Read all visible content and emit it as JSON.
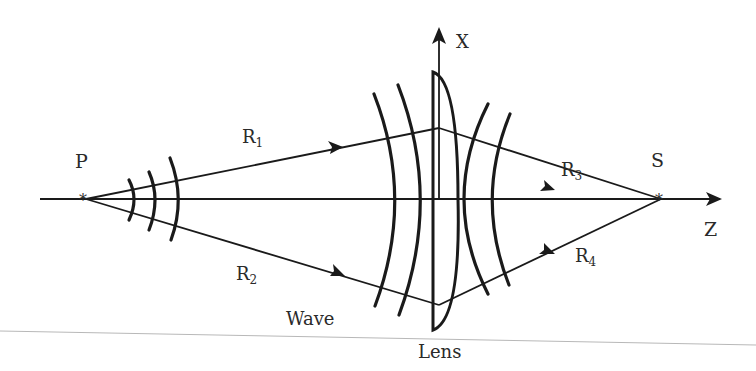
{
  "diagram": {
    "colors": {
      "ink": "#1a1a1a",
      "label": "#2a2a2a",
      "rule": "#b8b8b8",
      "background": "#ffffff"
    },
    "axes": {
      "z": {
        "label": "Z"
      },
      "x": {
        "label": "X"
      }
    },
    "points": [
      {
        "id": "source",
        "label": "P",
        "marker": "*"
      },
      {
        "id": "image",
        "label": "S",
        "marker": "*"
      }
    ],
    "rays": [
      {
        "id": "R1",
        "base": "R",
        "subscript": "1"
      },
      {
        "id": "R2",
        "base": "R",
        "subscript": "2"
      },
      {
        "id": "R3",
        "base": "R",
        "subscript": "3"
      },
      {
        "id": "R4",
        "base": "R",
        "subscript": "4"
      }
    ],
    "annotations": {
      "wave": "Wave",
      "lens": "Lens"
    }
  }
}
